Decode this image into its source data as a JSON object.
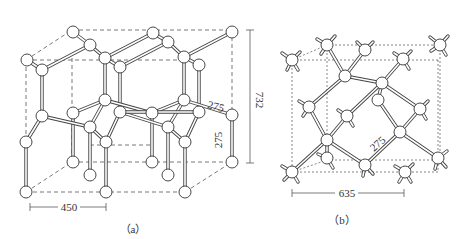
{
  "figure": {
    "panel_a": {
      "caption": "（a）",
      "dimensions": {
        "width_label": "450",
        "height_label": "732",
        "bond_label_horizontal": "275",
        "bond_label_vertical": "275"
      }
    },
    "panel_b": {
      "caption": "（b）",
      "dimensions": {
        "width_label": "635",
        "bond_label": "275"
      }
    }
  }
}
